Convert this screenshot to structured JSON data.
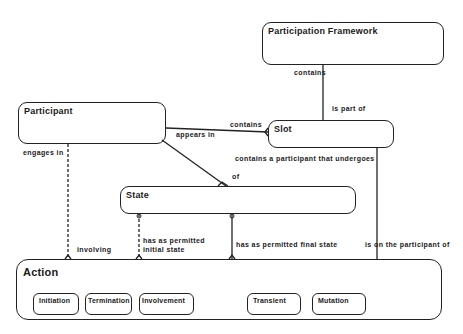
{
  "diagram": {
    "entities": {
      "participation_framework": "Participation Framework",
      "participant": "Participant",
      "slot": "Slot",
      "state": "State",
      "action": "Action"
    },
    "action_subtypes": [
      "Initiation",
      "Termination",
      "Involvement",
      "Transient",
      "Mutation"
    ],
    "relationships": {
      "pf_contains": "contains",
      "slot_is_part_of": "is part of",
      "slot_contains": "contains",
      "participant_appears_in": "appears in",
      "participant_engages_in": "engages in",
      "action_involving": "involving",
      "slot_contains_participant": "contains a participant that undergoes",
      "state_of": "of",
      "has_permitted_initial_state_1": "has as permitted",
      "has_permitted_initial_state_2": "initial state",
      "has_permitted_final_state": "has as permitted final state",
      "is_on_the_participant_of": "is on the participant of"
    }
  }
}
